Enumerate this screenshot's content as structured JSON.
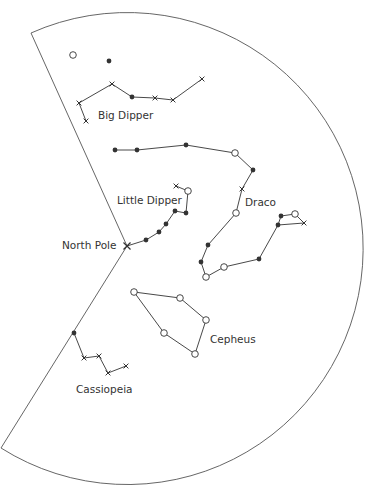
{
  "diagram": {
    "colors": {
      "line": "#333333",
      "frame": "#555555",
      "text": "#333333",
      "background": "#ffffff"
    },
    "frame": {
      "center": [
        127,
        246
      ],
      "radius": 236,
      "corner_top": [
        31,
        33
      ],
      "corner_bottom": [
        1,
        448
      ]
    },
    "north_pole": {
      "label": "North Pole",
      "position": [
        127,
        246
      ],
      "marker": "x",
      "label_position": [
        62,
        240
      ]
    },
    "legend_symbols": {
      "filled-circle": "bright star",
      "open-circle": "star",
      "x": "faint star"
    },
    "isolated_stars": [
      {
        "position": [
          73,
          55
        ],
        "marker": "open"
      },
      {
        "position": [
          109,
          61
        ],
        "marker": "dot"
      }
    ],
    "constellations": [
      {
        "name": "Big Dipper",
        "label_position": [
          98,
          110
        ],
        "stars": [
          [
            79,
            103,
            "x"
          ],
          [
            112,
            84,
            "x"
          ],
          [
            132,
            97,
            "dot"
          ],
          [
            155,
            98,
            "x"
          ],
          [
            173,
            100,
            "x"
          ],
          [
            202,
            79,
            "x"
          ],
          [
            86,
            121,
            "x"
          ]
        ],
        "lines": [
          [
            0,
            1
          ],
          [
            1,
            2
          ],
          [
            2,
            3
          ],
          [
            3,
            4
          ],
          [
            4,
            5
          ],
          [
            0,
            6
          ]
        ]
      },
      {
        "name": "Little Dipper",
        "label_position": [
          117,
          195
        ],
        "stars": [
          [
            146,
            240,
            "dot"
          ],
          [
            159,
            232,
            "dot"
          ],
          [
            166,
            224,
            "dot"
          ],
          [
            175,
            211,
            "dot"
          ],
          [
            186,
            213,
            "dot"
          ],
          [
            188,
            191,
            "open"
          ],
          [
            176,
            186,
            "x"
          ]
        ],
        "lines": [
          [
            0,
            1
          ],
          [
            1,
            2
          ],
          [
            2,
            3
          ],
          [
            3,
            4
          ],
          [
            4,
            5
          ],
          [
            5,
            6
          ]
        ],
        "start_from_pole": true
      },
      {
        "name": "Draco",
        "label_position": [
          245,
          197
        ],
        "stars": [
          [
            115,
            150,
            "dot"
          ],
          [
            137,
            150,
            "dot"
          ],
          [
            186,
            145,
            "dot"
          ],
          [
            235,
            153,
            "open"
          ],
          [
            253,
            170,
            "dot"
          ],
          [
            242,
            189,
            "x"
          ],
          [
            236,
            213,
            "open"
          ],
          [
            208,
            245,
            "dot"
          ],
          [
            201,
            262,
            "dot"
          ],
          [
            206,
            277,
            "open"
          ],
          [
            224,
            267,
            "open"
          ],
          [
            259,
            259,
            "dot"
          ],
          [
            278,
            225,
            "dot"
          ],
          [
            281,
            216,
            "dot"
          ],
          [
            295,
            214,
            "open"
          ],
          [
            304,
            223,
            "x"
          ]
        ],
        "lines": [
          [
            0,
            1
          ],
          [
            1,
            2
          ],
          [
            2,
            3
          ],
          [
            3,
            4
          ],
          [
            4,
            5
          ],
          [
            5,
            6
          ],
          [
            6,
            7
          ],
          [
            7,
            8
          ],
          [
            8,
            9
          ],
          [
            9,
            10
          ],
          [
            10,
            11
          ],
          [
            11,
            12
          ],
          [
            12,
            13
          ],
          [
            13,
            14
          ],
          [
            14,
            15
          ],
          [
            15,
            12
          ]
        ]
      },
      {
        "name": "Cepheus",
        "label_position": [
          210,
          334
        ],
        "stars": [
          [
            134,
            292,
            "open"
          ],
          [
            180,
            298,
            "open"
          ],
          [
            206,
            320,
            "open"
          ],
          [
            195,
            354,
            "open"
          ],
          [
            164,
            333,
            "open"
          ]
        ],
        "lines": [
          [
            0,
            1
          ],
          [
            1,
            2
          ],
          [
            2,
            3
          ],
          [
            3,
            4
          ],
          [
            4,
            0
          ]
        ]
      },
      {
        "name": "Cassiopeia",
        "label_position": [
          76,
          384
        ],
        "stars": [
          [
            74,
            333,
            "dot"
          ],
          [
            84,
            358,
            "x"
          ],
          [
            99,
            356,
            "x"
          ],
          [
            108,
            373,
            "x"
          ],
          [
            126,
            366,
            "x"
          ]
        ],
        "lines": [
          [
            0,
            1
          ],
          [
            1,
            2
          ],
          [
            2,
            3
          ],
          [
            3,
            4
          ]
        ]
      }
    ]
  }
}
